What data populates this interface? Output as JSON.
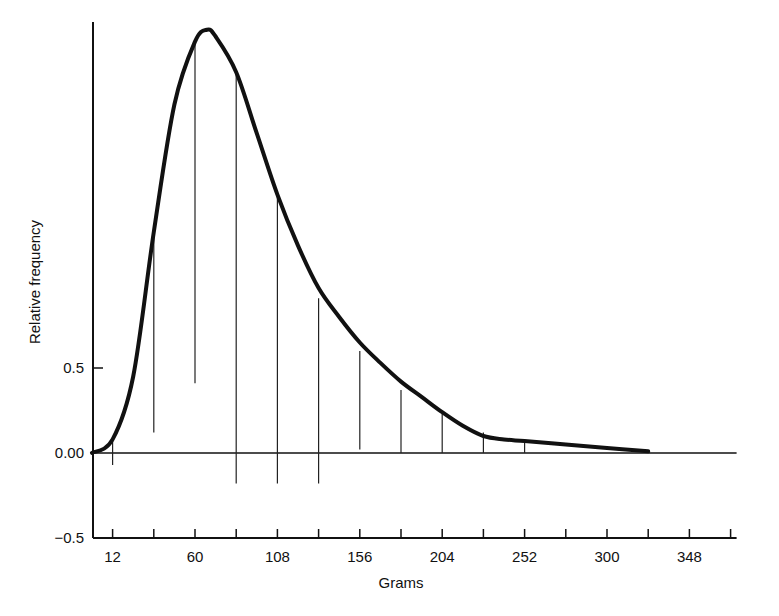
{
  "chart_data": {
    "type": "line",
    "title": "",
    "xlabel": "Grams",
    "ylabel": "Relative frequency",
    "xlim": [
      0,
      372
    ],
    "ylim": [
      -0.5,
      2.5
    ],
    "grid": false,
    "legend": null,
    "x_ticks": [
      12,
      36,
      60,
      84,
      108,
      132,
      156,
      180,
      204,
      228,
      252,
      276,
      300,
      324,
      348,
      372
    ],
    "x_tick_labels": [
      "12",
      "60",
      "108",
      "156",
      "204",
      "252",
      "300",
      "348"
    ],
    "x_tick_label_values": [
      12,
      60,
      108,
      156,
      204,
      252,
      300,
      348
    ],
    "y_tick_labels": [
      "−0.5",
      "0.00",
      "0.5"
    ],
    "y_tick_values": [
      -0.5,
      0.0,
      0.5
    ],
    "series": [
      {
        "name": "Density curve",
        "x": [
          0,
          12,
          24,
          36,
          48,
          60,
          67,
          72,
          84,
          96,
          108,
          120,
          132,
          144,
          156,
          168,
          180,
          192,
          204,
          216,
          228,
          240,
          252,
          276,
          300,
          324
        ],
        "y": [
          0.0,
          0.08,
          0.45,
          1.3,
          2.05,
          2.42,
          2.49,
          2.45,
          2.24,
          1.88,
          1.52,
          1.22,
          0.97,
          0.8,
          0.65,
          0.53,
          0.42,
          0.33,
          0.24,
          0.16,
          0.1,
          0.08,
          0.07,
          0.05,
          0.03,
          0.01
        ]
      }
    ],
    "vertical_segments": [
      {
        "x": 12,
        "y_top": 0.08,
        "y_bottom": -0.07
      },
      {
        "x": 36,
        "y_top": 1.32,
        "y_bottom": 0.12
      },
      {
        "x": 60,
        "y_top": 2.43,
        "y_bottom": 0.41
      },
      {
        "x": 84,
        "y_top": 2.24,
        "y_bottom": -0.18
      },
      {
        "x": 108,
        "y_top": 1.52,
        "y_bottom": -0.18
      },
      {
        "x": 132,
        "y_top": 0.91,
        "y_bottom": -0.18
      },
      {
        "x": 156,
        "y_top": 0.6,
        "y_bottom": 0.02
      },
      {
        "x": 180,
        "y_top": 0.37,
        "y_bottom": 0.0
      },
      {
        "x": 204,
        "y_top": 0.23,
        "y_bottom": 0.0
      },
      {
        "x": 228,
        "y_top": 0.12,
        "y_bottom": 0.0
      },
      {
        "x": 252,
        "y_top": 0.07,
        "y_bottom": 0.0
      }
    ]
  },
  "labels": {
    "xlabel": "Grams",
    "ylabel": "Relative frequency",
    "y_ticks": [
      "−0.5",
      "0.00",
      "0.5"
    ],
    "x_ticks": [
      "12",
      "60",
      "108",
      "156",
      "204",
      "252",
      "300",
      "348"
    ]
  }
}
